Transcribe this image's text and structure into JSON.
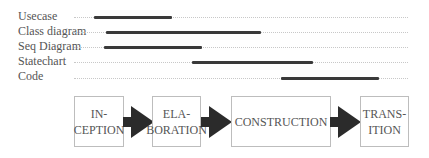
{
  "diagram": {
    "type": "timeline-phases",
    "activities": [
      {
        "label": "Usecase",
        "y": 16,
        "start": 94,
        "end": 172
      },
      {
        "label": "Class diagram",
        "y": 31,
        "start": 106,
        "end": 261
      },
      {
        "label": "Seq Diagram",
        "y": 46,
        "start": 104,
        "end": 202
      },
      {
        "label": "Statechart",
        "y": 61,
        "start": 192,
        "end": 313
      },
      {
        "label": "Code",
        "y": 77,
        "start": 281,
        "end": 379
      }
    ],
    "phases": [
      {
        "label": "IN-\nCEPTION",
        "left": 74,
        "width": 50
      },
      {
        "label": "ELA-\nBORATION",
        "left": 152,
        "width": 49
      },
      {
        "label": "CONSTRUCTION",
        "left": 231,
        "width": 100
      },
      {
        "label": "TRANS-\nITION",
        "left": 360,
        "width": 49
      }
    ],
    "colors": {
      "bar": "#3a3a3a",
      "arrow": "#2b2b2b",
      "box_border": "#bdbdbd",
      "track": "#c8c8c8"
    }
  }
}
